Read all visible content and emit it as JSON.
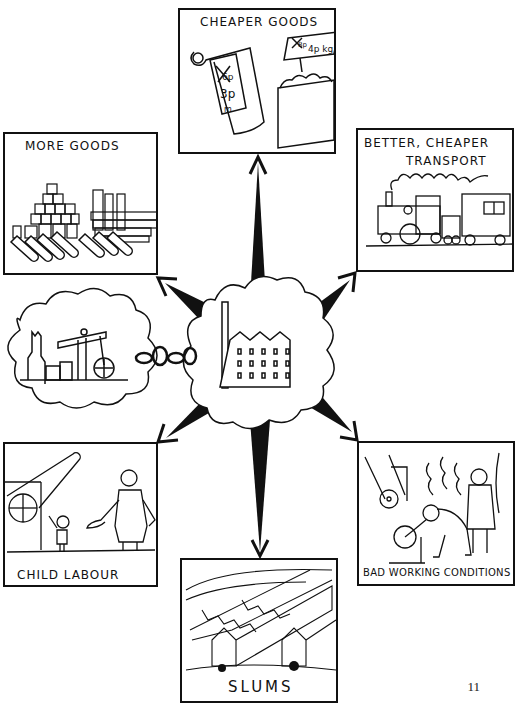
{
  "diagram": {
    "center": {
      "label": "Factory",
      "icon": "factory-icon"
    },
    "linked_cloud": {
      "label": "Mine / pithead winding engine",
      "icon": "mine-pithead-icon",
      "connector": "chain-icon"
    },
    "panels": [
      {
        "id": "cheaper-goods",
        "label": "CHEAPER GOODS",
        "price_tags": [
          "6p",
          "3p",
          "m",
          "8p",
          "4p kg"
        ],
        "icon": "price-tags-icon"
      },
      {
        "id": "more-goods",
        "label": "MORE GOODS",
        "icon": "stacked-goods-icon"
      },
      {
        "id": "better-transport",
        "label_line1": "BETTER, CHEAPER",
        "label_line2": "TRANSPORT",
        "icon": "steam-train-icon"
      },
      {
        "id": "child-labour",
        "label": "CHILD  LABOUR",
        "icon": "child-worker-icon"
      },
      {
        "id": "bad-working-conditions",
        "label": "BAD WORKING CONDITIONS",
        "icon": "overseer-worker-icon"
      },
      {
        "id": "slums",
        "label": "SLUMS",
        "icon": "terraced-houses-icon"
      }
    ],
    "arrows": [
      "up",
      "up-left",
      "up-right",
      "down-left",
      "down-right",
      "down"
    ]
  },
  "page": {
    "number": "11"
  }
}
